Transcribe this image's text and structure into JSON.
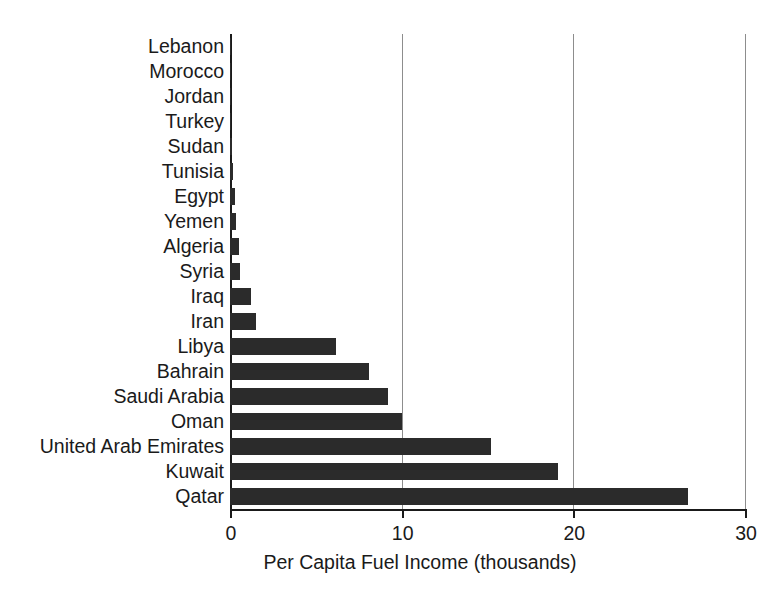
{
  "chart_data": {
    "type": "bar",
    "orientation": "horizontal",
    "title": "",
    "xlabel": "Per Capita Fuel Income (thousands)",
    "ylabel": "",
    "xlim": [
      0,
      30
    ],
    "xticks": [
      0,
      10,
      20,
      30
    ],
    "xtick_labels": [
      "0",
      "10",
      "20",
      "30"
    ],
    "grid": "vertical",
    "legend": "none",
    "bar_color": "#2b2b2b",
    "categories": [
      "Lebanon",
      "Morocco",
      "Jordan",
      "Turkey",
      "Sudan",
      "Tunisia",
      "Egypt",
      "Yemen",
      "Algeria",
      "Syria",
      "Iraq",
      "Iran",
      "Libya",
      "Bahrain",
      "Saudi Arabia",
      "Oman",
      "United Arab Emirates",
      "Kuwait",
      "Qatar"
    ],
    "values": [
      0.02,
      0.03,
      0.04,
      0.05,
      0.1,
      0.2,
      0.3,
      0.35,
      0.5,
      0.6,
      1.2,
      1.5,
      6.2,
      8.1,
      9.2,
      10.0,
      15.2,
      19.1,
      26.7
    ]
  }
}
